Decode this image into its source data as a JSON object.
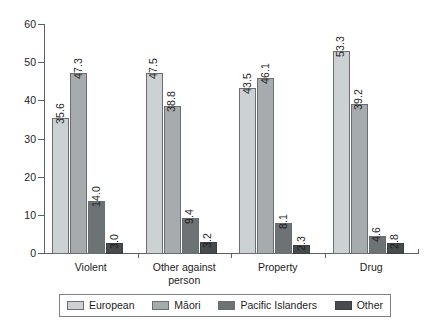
{
  "chart_data": {
    "type": "bar",
    "title": "",
    "subtitle": "",
    "xlabel": "",
    "ylabel": "",
    "categories": [
      "Violent",
      "Other against\nperson",
      "Property",
      "Drug"
    ],
    "series": [
      {
        "name": "European",
        "color": "#ccd1d4",
        "values": [
          35.6,
          47.5,
          43.5,
          53.3
        ]
      },
      {
        "name": "Māori",
        "color": "#a6abad",
        "values": [
          47.3,
          38.8,
          46.1,
          39.2
        ]
      },
      {
        "name": "Pacific Islanders",
        "color": "#6d7275",
        "values": [
          14.0,
          9.4,
          8.1,
          4.6
        ]
      },
      {
        "name": "Other",
        "color": "#474b4d",
        "values": [
          3.0,
          3.2,
          2.3,
          2.8
        ]
      }
    ],
    "value_labels": [
      [
        "35.6",
        "47.3",
        "14.0",
        "3.0"
      ],
      [
        "47.5",
        "38.8",
        "9.4",
        "3.2"
      ],
      [
        "43.5",
        "46.1",
        "8.1",
        "2.3"
      ],
      [
        "53.3",
        "39.2",
        "4.6",
        "2.8"
      ]
    ],
    "ylim": [
      0,
      60
    ],
    "yticks": [
      0,
      10,
      20,
      30,
      40,
      50,
      60
    ],
    "ytick_labels": [
      "0",
      "10",
      "20",
      "30",
      "40",
      "50",
      "60"
    ],
    "grid": false,
    "legend_position": "bottom",
    "value_label_rotation": -90
  },
  "legend": {
    "items": [
      {
        "label": "European"
      },
      {
        "label": "Māori"
      },
      {
        "label": "Pacific Islanders"
      },
      {
        "label": "Other"
      }
    ]
  }
}
